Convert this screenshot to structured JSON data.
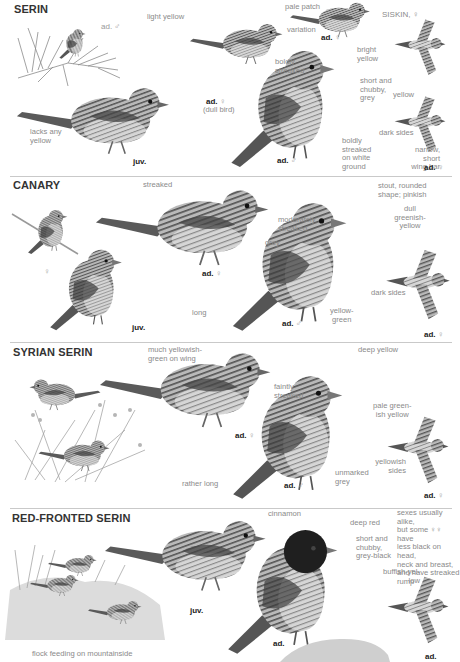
{
  "page": {
    "colors": {
      "background": "#ffffff",
      "title": "#333333",
      "label": "#8a8a8a",
      "rule": "#c9c9c9",
      "bird_dark": "#4a4a4a",
      "bird_mid": "#8d8d8d",
      "bird_light": "#cfcfcf",
      "redfront_head": "#222222"
    }
  },
  "sections": [
    {
      "title": "SERIN",
      "labels": {
        "l1": "ad. ♂",
        "l2": "light yellow",
        "l3": "pale patch",
        "l4": "variation",
        "l5": "SISKIN, ♀",
        "l6": "bright\nyellow",
        "l7": "boldly\nstreaked",
        "l8": "short and\nchubby,\ngrey",
        "l9": "yellow",
        "l10": "lacks any\nyellow",
        "l11": "dark sides",
        "l12": "boldly\nstreaked\non white\nground",
        "l13": "narrow,\nshort\nwing bar"
      },
      "ages": {
        "a1": "ad.",
        "a1s": "♀",
        "a1n": "(dull bird)",
        "a2": "ad.",
        "a2s": "♀",
        "a3": "juv.",
        "a4": "ad.",
        "a4s": "♂",
        "a5": "ad.",
        "a5s": "♀"
      }
    },
    {
      "title": "CANARY",
      "labels": {
        "l1": "streaked",
        "l2": "moderately\nstreaked",
        "l3": "stout, rounded\nshape; pinkish",
        "l4": "grey",
        "l5": "dull\ngreenish-\nyellow",
        "l6": "dark sides",
        "l7": "long",
        "l8": "yellow-\ngreen"
      },
      "ages": {
        "a1": "♀",
        "a2": "ad.",
        "a2s": "♀",
        "a3": "juv.",
        "a4": "ad.",
        "a4s": "♂",
        "a5": "ad.",
        "a5s": "♀"
      }
    },
    {
      "title": "SYRIAN SERIN",
      "labels": {
        "l1": "much yellowish-\ngreen on wing",
        "l2": "deep yellow",
        "l3": "faintly\nstreaked",
        "l4": "pale green-\nish yellow",
        "l5": "yellowish\nsides",
        "l6": "rather long",
        "l7": "unmarked\ngrey"
      },
      "ages": {
        "a1": "ad.",
        "a1s": "♀",
        "a2": "ad.",
        "a2s": "♂",
        "a3": "ad.",
        "a3s": "♀"
      }
    },
    {
      "title": "RED-FRONTED SERIN",
      "labels": {
        "l1": "cinnamon",
        "l2": "deep red",
        "l3": "sexes usually alike,\nbut some ♀♀ have\nless black on head,\nneck and breast,\nand have streaked\nrump",
        "l4": "short and\nchubby,\ngrey-black",
        "l5": "buffish-yel-\nlow",
        "l6": "flock feeding on mountainside"
      },
      "ages": {
        "a1": "juv.",
        "a2": "ad.",
        "a3": "ad."
      }
    }
  ]
}
